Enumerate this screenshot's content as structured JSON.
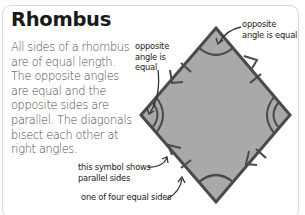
{
  "title": "Rhombus",
  "description": "All sides of a rhombus are of equal length. The opposite angles are equal and the opposite sides are parallel. The diagonals bisect each other at right angles.",
  "annotations": {
    "top_right": "opposite\nangle is equal",
    "left": "opposite\nangle is\nequal",
    "parallel_symbol": "this symbol shows\nparallel sides",
    "equal_side": "one of four equal sides"
  },
  "colors": {
    "shape_fill": "#a9a9a9",
    "shape_outline": "#4a4a4a",
    "card_border": "#d8d8d8",
    "title_text": "#1a1a1a",
    "body_text": "#4a4a4a"
  }
}
